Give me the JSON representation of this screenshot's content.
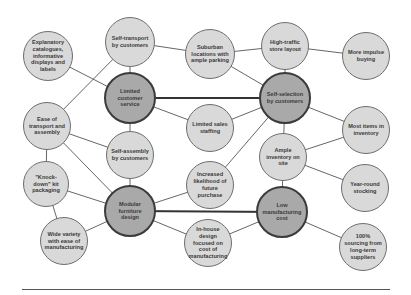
{
  "diagram": {
    "type": "activity-system-map",
    "colors": {
      "minor_fill": "#d9d9d9",
      "major_fill": "#a9a9a9",
      "line": "#555555"
    },
    "nodes": [
      {
        "id": "explanatory",
        "label": "Explanatory catalogues, informative displays and labels",
        "x": 48,
        "y": 56,
        "r": 25,
        "major": false
      },
      {
        "id": "self_transport",
        "label": "Self-transport by customers",
        "x": 130,
        "y": 42,
        "r": 25,
        "major": false
      },
      {
        "id": "suburban",
        "label": "Suburban locations with ample parking",
        "x": 210,
        "y": 54,
        "r": 25,
        "major": false
      },
      {
        "id": "high_traffic",
        "label": "High-traffic store layout",
        "x": 285,
        "y": 46,
        "r": 24,
        "major": false
      },
      {
        "id": "impulse",
        "label": "More impulse buying",
        "x": 366,
        "y": 56,
        "r": 24,
        "major": false
      },
      {
        "id": "limited_service",
        "label": "Limited customer service",
        "x": 130,
        "y": 98,
        "r": 26,
        "major": true
      },
      {
        "id": "self_selection",
        "label": "Self-selection by customers",
        "x": 285,
        "y": 98,
        "r": 26,
        "major": true
      },
      {
        "id": "ease_transport",
        "label": "Ease of transport and assembly",
        "x": 47,
        "y": 126,
        "r": 24,
        "major": false
      },
      {
        "id": "limited_staff",
        "label": "Limited sales staffing",
        "x": 210,
        "y": 128,
        "r": 24,
        "major": false
      },
      {
        "id": "most_items",
        "label": "Most items in inventory",
        "x": 366,
        "y": 130,
        "r": 24,
        "major": false
      },
      {
        "id": "self_assembly",
        "label": "Self-assembly by customers",
        "x": 130,
        "y": 155,
        "r": 24,
        "major": false
      },
      {
        "id": "ample_inventory",
        "label": "Ample inventory on site",
        "x": 283,
        "y": 157,
        "r": 24,
        "major": false
      },
      {
        "id": "knock_down",
        "label": "\"Knock-down\" kit packaging",
        "x": 46,
        "y": 184,
        "r": 23,
        "major": false
      },
      {
        "id": "increased",
        "label": "Increased likelihood of future purchase",
        "x": 210,
        "y": 185,
        "r": 24,
        "major": false
      },
      {
        "id": "year_round",
        "label": "Year-round stocking",
        "x": 365,
        "y": 188,
        "r": 24,
        "major": false
      },
      {
        "id": "modular",
        "label": "Modular furniture design",
        "x": 130,
        "y": 211,
        "r": 26,
        "major": true
      },
      {
        "id": "low_cost",
        "label": "Low manufacturing cost",
        "x": 282,
        "y": 212,
        "r": 26,
        "major": true
      },
      {
        "id": "wide_variety",
        "label": "Wide variety with ease of manufacturing",
        "x": 64,
        "y": 241,
        "r": 24,
        "major": false
      },
      {
        "id": "in_house",
        "label": "In-house design focused on cost of manufacturing",
        "x": 208,
        "y": 243,
        "r": 24,
        "major": false
      },
      {
        "id": "sourcing",
        "label": "100% sourcing from long-term suppliers",
        "x": 363,
        "y": 247,
        "r": 24,
        "major": false
      }
    ],
    "edges": [
      {
        "from": "explanatory",
        "to": "limited_service",
        "thick": false
      },
      {
        "from": "self_transport",
        "to": "limited_service",
        "thick": false
      },
      {
        "from": "self_transport",
        "to": "suburban",
        "thick": false
      },
      {
        "from": "self_transport",
        "to": "ease_transport",
        "thick": false
      },
      {
        "from": "suburban",
        "to": "high_traffic",
        "thick": false
      },
      {
        "from": "suburban",
        "to": "self_selection",
        "thick": false
      },
      {
        "from": "high_traffic",
        "to": "self_selection",
        "thick": false
      },
      {
        "from": "high_traffic",
        "to": "impulse",
        "thick": false
      },
      {
        "from": "limited_service",
        "to": "self_selection",
        "thick": true
      },
      {
        "from": "limited_service",
        "to": "limited_staff",
        "thick": false
      },
      {
        "from": "limited_service",
        "to": "self_assembly",
        "thick": false
      },
      {
        "from": "limited_staff",
        "to": "self_selection",
        "thick": false
      },
      {
        "from": "self_selection",
        "to": "most_items",
        "thick": false
      },
      {
        "from": "self_selection",
        "to": "ample_inventory",
        "thick": false
      },
      {
        "from": "self_selection",
        "to": "increased",
        "thick": false
      },
      {
        "from": "ease_transport",
        "to": "self_assembly",
        "thick": false
      },
      {
        "from": "ease_transport",
        "to": "modular",
        "thick": false
      },
      {
        "from": "ease_transport",
        "to": "knock_down",
        "thick": false
      },
      {
        "from": "self_assembly",
        "to": "modular",
        "thick": false
      },
      {
        "from": "knock_down",
        "to": "modular",
        "thick": false
      },
      {
        "from": "knock_down",
        "to": "wide_variety",
        "thick": false
      },
      {
        "from": "wide_variety",
        "to": "modular",
        "thick": false
      },
      {
        "from": "modular",
        "to": "increased",
        "thick": false
      },
      {
        "from": "modular",
        "to": "low_cost",
        "thick": true
      },
      {
        "from": "modular",
        "to": "in_house",
        "thick": false
      },
      {
        "from": "in_house",
        "to": "low_cost",
        "thick": false
      },
      {
        "from": "ample_inventory",
        "to": "most_items",
        "thick": false
      },
      {
        "from": "ample_inventory",
        "to": "year_round",
        "thick": false
      },
      {
        "from": "ample_inventory",
        "to": "low_cost",
        "thick": false
      },
      {
        "from": "low_cost",
        "to": "sourcing",
        "thick": false
      }
    ],
    "footer_rule": true
  }
}
